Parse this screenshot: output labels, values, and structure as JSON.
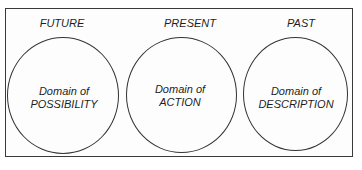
{
  "diagram": {
    "domains": [
      {
        "time_label": "FUTURE",
        "line1": "Domain of",
        "line2": "POSSIBILITY",
        "cx": 63,
        "cy": 95,
        "w": 112,
        "h": 117,
        "label_x": 62
      },
      {
        "time_label": "PRESENT",
        "line1": "Domain of",
        "line2": "ACTION",
        "cx": 182,
        "cy": 95,
        "w": 111,
        "h": 116,
        "label_x": 190
      },
      {
        "time_label": "PAST",
        "line1": "Domain of",
        "line2": "DESCRIPTION",
        "cx": 295,
        "cy": 94,
        "w": 105,
        "h": 114,
        "label_x": 301
      }
    ],
    "colors": {
      "stroke": "#333333",
      "text": "#1e1e1e",
      "background": "#ffffff"
    }
  }
}
